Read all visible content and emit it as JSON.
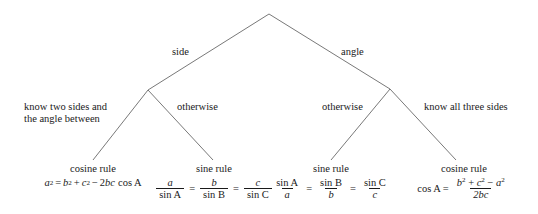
{
  "diagram": {
    "line_color": "#555555",
    "text_color": "#1a1a1a",
    "background": "#ffffff",
    "root": {
      "label": ""
    },
    "branches": [
      {
        "name": "side-branch",
        "label": "side"
      },
      {
        "name": "angle-branch",
        "label": "angle"
      }
    ],
    "conditions": [
      {
        "name": "condition-two-sides-angle",
        "line1": "know two sides and",
        "line2": "the angle between"
      },
      {
        "name": "condition-otherwise-left",
        "label": "otherwise"
      },
      {
        "name": "condition-otherwise-right",
        "label": "otherwise"
      },
      {
        "name": "condition-all-three-sides",
        "label": "know all three sides"
      }
    ],
    "leaves": [
      {
        "name": "leaf-cosine-rule-side",
        "title": "cosine rule",
        "formula_plain": "a^2 = b^2 + c^2 - 2bc cos A",
        "parts": {
          "a": "a",
          "exp2": "2",
          "eq": "=",
          "b": "b",
          "plus": "+",
          "c": "c",
          "minus": "−",
          "two": "2",
          "bc": "bc",
          "cos": "cos A"
        }
      },
      {
        "name": "leaf-sine-rule-side",
        "title": "sine rule",
        "formula_plain": "a / sin A = b / sin B = c / sin C",
        "parts": {
          "n1": "a",
          "d1": "sin A",
          "eq1": "=",
          "n2": "b",
          "d2": "sin B",
          "eq2": "=",
          "n3": "c",
          "d3": "sin C"
        }
      },
      {
        "name": "leaf-sine-rule-angle",
        "title": "sine rule",
        "formula_plain": "sin A / a = sin B / b = sin C / c",
        "parts": {
          "n1": "sin A",
          "d1": "a",
          "eq1": "=",
          "n2": "sin B",
          "d2": "b",
          "eq2": "=",
          "n3": "sin C",
          "d3": "c"
        }
      },
      {
        "name": "leaf-cosine-rule-angle",
        "title": "cosine rule",
        "formula_plain": "cos A = (b^2 + c^2 - a^2) / 2bc",
        "parts": {
          "cos": "cos A",
          "eq": "=",
          "b": "b",
          "plus": "+",
          "c": "c",
          "minus": "−",
          "a": "a",
          "exp2": "2",
          "den": "2bc"
        }
      }
    ]
  }
}
